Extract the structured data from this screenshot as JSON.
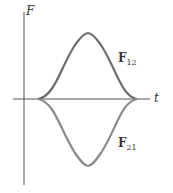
{
  "diagram": {
    "y_axis_label": "F",
    "x_axis_label": "t",
    "curves": [
      {
        "name": "F",
        "subscript": "12",
        "direction": "positive",
        "color": "#6b6b6b"
      },
      {
        "name": "F",
        "subscript": "21",
        "direction": "negative",
        "color": "#8a8a8a"
      }
    ],
    "colors": {
      "axis": "#555555",
      "upper_curve": "#6b6b6b",
      "lower_curve": "#8a8a8a"
    }
  }
}
